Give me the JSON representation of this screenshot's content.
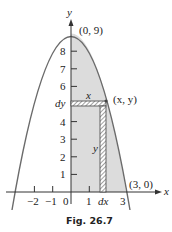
{
  "figure": {
    "caption": "Fig. 26.7",
    "axes": {
      "x_label": "x",
      "y_label": "y",
      "x_ticks": [
        "−2",
        "−1",
        "0",
        "1",
        "dx",
        "3"
      ],
      "y_ticks": [
        "1",
        "2",
        "3",
        "4",
        "dy",
        "6",
        "7",
        "8"
      ]
    },
    "annotations": {
      "vertex": "(0, 9)",
      "x_intercept": "(3, 0)",
      "point": "(x, y)",
      "horizontal_strip_label": "x",
      "vertical_strip_label": "y",
      "dy_label": "dy",
      "dx_label": "dx"
    },
    "curve": "y = 9 − x²",
    "colors": {
      "curve": "#6b6b6b",
      "shaded_region": "#dcdcdc",
      "axis": "#333333"
    }
  }
}
